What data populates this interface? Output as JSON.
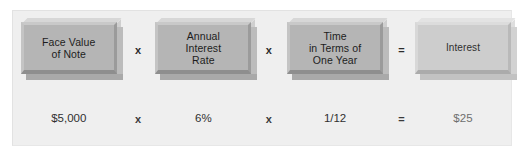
{
  "figure": {
    "background_color": "#ffffff",
    "panel_color": "#efefef",
    "box_color": "#b5b5b5",
    "result_box_color": "#cdcdcd",
    "text_color": "#1d1d1d"
  },
  "formula": {
    "terms": [
      {
        "id": "face-value",
        "label_lines": [
          "Face Value",
          "of Note"
        ],
        "label": "Face Value of Note",
        "value": "$5,000",
        "is_result": false
      },
      {
        "id": "annual-interest-rate",
        "label_lines": [
          "Annual",
          "Interest",
          "Rate"
        ],
        "label": "Annual Interest Rate",
        "value": "6%",
        "is_result": false
      },
      {
        "id": "time-in-terms-of-one-year",
        "label_lines": [
          "Time",
          "in Terms of",
          "One Year"
        ],
        "label": "Time in Terms of One Year",
        "value": "1/12",
        "is_result": false
      },
      {
        "id": "interest",
        "label_lines": [
          "Interest"
        ],
        "label": "Interest",
        "value": "$25",
        "is_result": true
      }
    ],
    "operators": [
      {
        "id": "multiply-1",
        "symbol": "x",
        "name": "multiplication-operator"
      },
      {
        "id": "multiply-2",
        "symbol": "x",
        "name": "multiplication-operator"
      },
      {
        "id": "equals",
        "symbol": "=",
        "name": "equals-operator"
      }
    ]
  }
}
